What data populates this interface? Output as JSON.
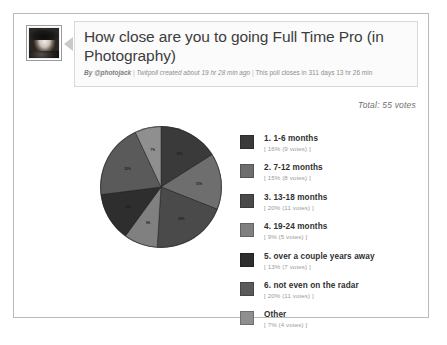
{
  "poll": {
    "avatar_alt": "photojack-avatar",
    "title": "How close are you to going Full Time Pro (in Photography)",
    "meta": {
      "by_prefix": "By ",
      "author": "@photojack",
      "sep1": " | ",
      "created": "Twitpoll created about 19 hr 28 min ago",
      "sep2": " | ",
      "closes": "This poll closes in 311 days 13 hr 26 min"
    },
    "total_votes_text": "Total: 55 votes"
  },
  "chart_data": {
    "type": "pie",
    "title": "How close are you to going Full Time Pro (in Photography)",
    "total_votes": 55,
    "legend_position": "right",
    "categories": [
      "1. 1-6 months",
      "2. 7-12 months",
      "3. 13-18 months",
      "4. 19-24 months",
      "5. over a couple years away",
      "6. not even on the radar",
      "Other"
    ],
    "values": [
      16,
      15,
      20,
      9,
      13,
      20,
      7
    ],
    "votes": [
      9,
      8,
      11,
      5,
      7,
      11,
      4
    ],
    "slice_labels": [
      "16%",
      "15%",
      "20%",
      "9%",
      "13%",
      "20%",
      "7%"
    ],
    "colors": [
      "#3a3a3a",
      "#6e6e6e",
      "#4a4a4a",
      "#808080",
      "#2e2e2e",
      "#5a5a5a",
      "#8f8f8f"
    ],
    "slices": [
      {
        "index": 1,
        "label": "1. 1-6 months",
        "percent": "16%",
        "votes_text": "[ 16% (9 votes) ]",
        "color": "#3a3a3a"
      },
      {
        "index": 2,
        "label": "2. 7-12 months",
        "percent": "15%",
        "votes_text": "[ 15% (8 votes) ]",
        "color": "#6e6e6e"
      },
      {
        "index": 3,
        "label": "3. 13-18 months",
        "percent": "20%",
        "votes_text": "[ 20% (11 votes) ]",
        "color": "#4a4a4a"
      },
      {
        "index": 4,
        "label": "4. 19-24 months",
        "percent": "9%",
        "votes_text": "[ 9% (5 votes) ]",
        "color": "#808080"
      },
      {
        "index": 5,
        "label": "5. over a couple years away",
        "percent": "13%",
        "votes_text": "[ 13% (7 votes) ]",
        "color": "#2e2e2e"
      },
      {
        "index": 6,
        "label": "6. not even on the radar",
        "percent": "20%",
        "votes_text": "[ 20% (11 votes) ]",
        "color": "#5a5a5a"
      },
      {
        "index": 7,
        "label": "Other",
        "percent": "7%",
        "votes_text": "[ 7% (4 votes) ]",
        "color": "#8f8f8f"
      }
    ]
  }
}
